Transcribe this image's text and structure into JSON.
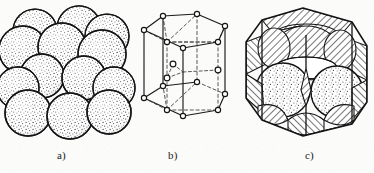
{
  "figure": {
    "background_color": "#fbfbfa",
    "ink_color": "#1a1a1a",
    "panel_count": 3
  },
  "captions": {
    "a": "a)",
    "b": "b)",
    "c": "c)"
  },
  "panels": [
    {
      "id": "a",
      "caption": "a)",
      "name": "hard-sphere-packing",
      "description": "Close-packed arrangement of stippled spheres in two stacked layers",
      "sphere_count": 17,
      "sphere_fill": "#ffffff",
      "sphere_texture": "stipple",
      "outline_color": "#141414"
    },
    {
      "id": "b",
      "caption": "b)",
      "name": "hcp-unit-cell-wireframe",
      "description": "Hexagonal prism unit cell wireframe with open-circle lattice points and three interior midplane atoms",
      "corner_atom_count": 12,
      "center_atom_count": 2,
      "interior_atom_count": 3,
      "solid_edge_color": "#141414",
      "dashed_edge_color": "#3a3a3a"
    },
    {
      "id": "c",
      "caption": "c)",
      "name": "hcp-cell-with-spheres",
      "description": "Hexagonal unit cell filled with spheres cut by the cell faces; hatched regions mark cut sphere sections",
      "hatch_angle_deg": 45,
      "hatch_color": "#141414",
      "whole_sphere_count": 2
    }
  ],
  "legend": {
    "hatching_meaning": "cut sphere sections",
    "stipple_meaning": "sphere surface"
  }
}
